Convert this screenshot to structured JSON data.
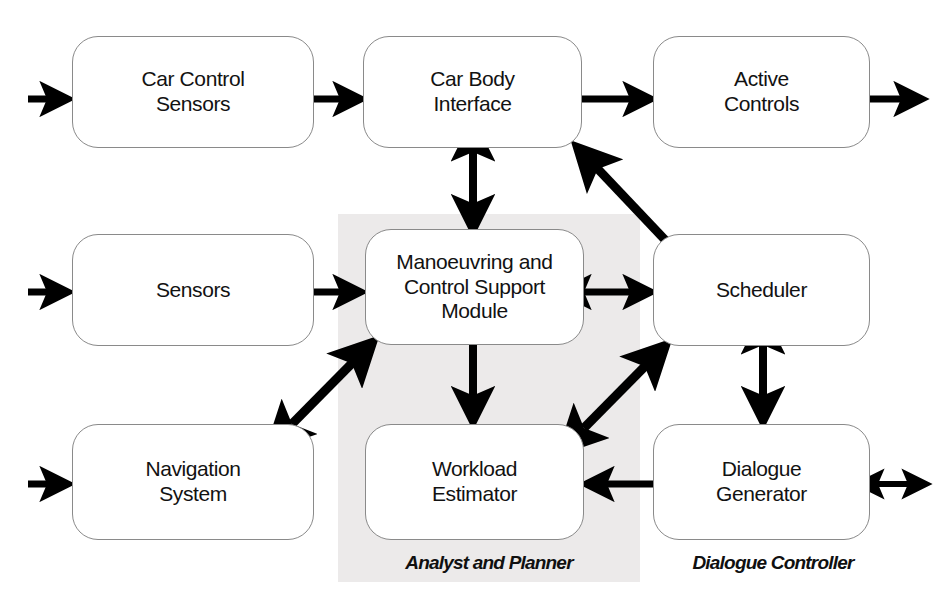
{
  "diagram": {
    "background_color": "#ffffff",
    "shaded_region_color": "#eceaea",
    "line_color": "#000000",
    "box_border_color": "#8a8a8a"
  },
  "nodes": [
    {
      "id": "car-control-sensors",
      "label": "Car Control\nSensors"
    },
    {
      "id": "car-body-interface",
      "label": "Car Body\nInterface"
    },
    {
      "id": "active-controls",
      "label": "Active\nControls"
    },
    {
      "id": "sensors",
      "label": "Sensors"
    },
    {
      "id": "mcsm",
      "label": "Manoeuvring and\nControl Support\nModule"
    },
    {
      "id": "scheduler",
      "label": "Scheduler"
    },
    {
      "id": "navigation-system",
      "label": "Navigation\nSystem"
    },
    {
      "id": "workload-estimator",
      "label": "Workload\nEstimator"
    },
    {
      "id": "dialogue-generator",
      "label": "Dialogue\nGenerator"
    }
  ],
  "group_labels": [
    {
      "id": "analyst-and-planner",
      "label": "Analyst and Planner"
    },
    {
      "id": "dialogue-controller",
      "label": "Dialogue Controller"
    }
  ],
  "connections": [
    {
      "id": "in-car-control-sensors",
      "from": "external",
      "to": "car-control-sensors",
      "heads": "single"
    },
    {
      "id": "in-sensors",
      "from": "external",
      "to": "sensors",
      "heads": "single"
    },
    {
      "id": "in-navigation-system",
      "from": "external",
      "to": "navigation-system",
      "heads": "single"
    },
    {
      "id": "car-control-sensors-to-car-body-interface",
      "from": "car-control-sensors",
      "to": "car-body-interface",
      "heads": "single"
    },
    {
      "id": "car-body-interface-to-active-controls",
      "from": "car-body-interface",
      "to": "active-controls",
      "heads": "single"
    },
    {
      "id": "out-active-controls",
      "from": "active-controls",
      "to": "external",
      "heads": "single"
    },
    {
      "id": "sensors-to-mcsm",
      "from": "sensors",
      "to": "mcsm",
      "heads": "single"
    },
    {
      "id": "car-body-interface-mcsm",
      "from": "car-body-interface",
      "to": "mcsm",
      "heads": "double"
    },
    {
      "id": "mcsm-scheduler",
      "from": "mcsm",
      "to": "scheduler",
      "heads": "double"
    },
    {
      "id": "scheduler-to-car-body-interface",
      "from": "scheduler",
      "to": "car-body-interface",
      "heads": "single"
    },
    {
      "id": "navigation-system-mcsm",
      "from": "navigation-system",
      "to": "mcsm",
      "heads": "double"
    },
    {
      "id": "mcsm-to-workload-estimator",
      "from": "mcsm",
      "to": "workload-estimator",
      "heads": "single"
    },
    {
      "id": "workload-estimator-scheduler",
      "from": "workload-estimator",
      "to": "scheduler",
      "heads": "double"
    },
    {
      "id": "scheduler-dialogue-generator",
      "from": "scheduler",
      "to": "dialogue-generator",
      "heads": "double"
    },
    {
      "id": "dialogue-generator-to-workload-estimator",
      "from": "dialogue-generator",
      "to": "workload-estimator",
      "heads": "single"
    },
    {
      "id": "out-dialogue-generator",
      "from": "dialogue-generator",
      "to": "external",
      "heads": "double"
    }
  ]
}
